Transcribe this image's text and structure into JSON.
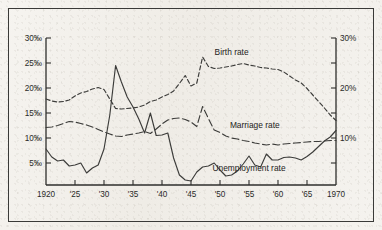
{
  "chart_data": {
    "type": "line",
    "title": "",
    "xlabel": "",
    "ylabel": "",
    "grid": false,
    "legend_position": "inline-annotations",
    "x": [
      1920,
      1921,
      1922,
      1923,
      1924,
      1925,
      1926,
      1927,
      1928,
      1929,
      1930,
      1931,
      1932,
      1933,
      1934,
      1935,
      1936,
      1937,
      1938,
      1939,
      1940,
      1941,
      1942,
      1943,
      1944,
      1945,
      1946,
      1947,
      1948,
      1949,
      1950,
      1951,
      1952,
      1953,
      1954,
      1955,
      1956,
      1957,
      1958,
      1959,
      1960,
      1961,
      1962,
      1963,
      1964,
      1965,
      1966,
      1967,
      1968,
      1969,
      1970
    ],
    "xlim": [
      1920,
      1970
    ],
    "ylim": [
      0,
      30
    ],
    "left_axis": {
      "unit": "per-mille",
      "ticks": [
        30,
        25,
        20,
        15,
        10,
        5
      ],
      "tick_labels": [
        "30‰",
        "25‰",
        "20‰",
        "15‰",
        "10‰",
        "5‰"
      ]
    },
    "right_axis": {
      "unit": "percent",
      "ticks": [
        30,
        25,
        20,
        15,
        10,
        5
      ],
      "tick_labels": [
        "30%",
        "",
        "20%",
        "",
        "10%",
        ""
      ]
    },
    "x_tick_values": [
      1920,
      1925,
      1930,
      1935,
      1940,
      1945,
      1950,
      1955,
      1960,
      1965,
      1970
    ],
    "x_tick_labels": [
      "1920",
      "'25",
      "'30",
      "'35",
      "'40",
      "'45",
      "'50",
      "'55",
      "'60",
      "'65",
      "1970"
    ],
    "series": [
      {
        "name": "Birth rate",
        "style": "dashed",
        "axis": "left",
        "label_x": 1952,
        "label_y": 26.6,
        "values": [
          17.8,
          17.4,
          17.2,
          17.3,
          17.6,
          18.4,
          19.0,
          19.3,
          19.8,
          20.1,
          19.7,
          17.8,
          15.9,
          15.8,
          15.9,
          16.0,
          16.2,
          16.6,
          17.3,
          17.6,
          18.2,
          18.7,
          19.4,
          20.9,
          22.5,
          20.4,
          21.0,
          26.2,
          24.3,
          23.9,
          24.0,
          24.2,
          24.4,
          24.7,
          24.9,
          24.6,
          24.4,
          24.1,
          24.0,
          23.8,
          23.7,
          23.2,
          22.4,
          21.6,
          21.0,
          19.9,
          18.6,
          17.3,
          16.0,
          14.6,
          13.5
        ]
      },
      {
        "name": "Marriage rate",
        "style": "long-dashed",
        "axis": "left",
        "label_x": 1956,
        "label_y": 12.0,
        "values": [
          12.1,
          12.2,
          12.5,
          12.9,
          13.3,
          13.2,
          12.9,
          12.6,
          12.2,
          11.7,
          11.2,
          10.8,
          10.4,
          10.3,
          10.6,
          10.8,
          11.0,
          11.3,
          10.9,
          11.8,
          12.8,
          13.6,
          13.9,
          14.0,
          13.7,
          13.2,
          12.3,
          16.3,
          13.9,
          11.6,
          11.1,
          10.4,
          10.0,
          9.8,
          9.5,
          9.3,
          9.0,
          8.8,
          8.6,
          8.8,
          8.6,
          8.8,
          8.9,
          9.0,
          9.1,
          9.2,
          9.3,
          9.3,
          9.4,
          9.5,
          9.5
        ]
      },
      {
        "name": "Unemployment rate",
        "style": "solid",
        "axis": "right",
        "label_x": 1955,
        "label_y": 3.4,
        "values": [
          7.8,
          6.2,
          5.4,
          5.6,
          4.4,
          4.6,
          5.0,
          3.0,
          4.0,
          4.6,
          7.8,
          14.6,
          24.5,
          21.2,
          18.2,
          16.2,
          13.8,
          11.0,
          15.0,
          10.5,
          10.6,
          11.0,
          6.0,
          2.6,
          1.6,
          1.4,
          3.2,
          4.2,
          4.4,
          5.0,
          3.6,
          2.4,
          2.6,
          3.4,
          4.8,
          6.4,
          4.6,
          4.2,
          6.8,
          5.6,
          5.6,
          6.1,
          6.2,
          6.0,
          5.6,
          6.3,
          7.2,
          8.3,
          9.4,
          10.2,
          11.5
        ]
      }
    ]
  },
  "figure": {
    "border_color": "#3a3a38",
    "line_color": "#3c3c3a",
    "paper_color": "#f4f2ee"
  }
}
